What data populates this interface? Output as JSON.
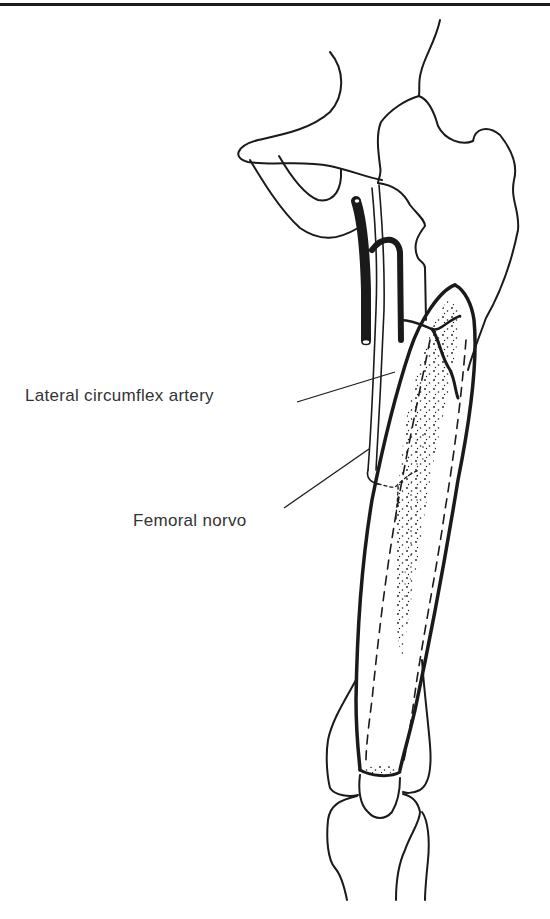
{
  "figure": {
    "type": "anatomical-line-drawing",
    "colors": {
      "ink": "#1a1a1a",
      "background": "#ffffff",
      "label_text": "#333333"
    },
    "labels": [
      {
        "id": "lateral-circumflex-artery",
        "text": "Lateral circumflex artery"
      },
      {
        "id": "femoral-nerve",
        "text": "Femoral norvo"
      }
    ],
    "structures": [
      "pelvis-ilium",
      "femoral-head",
      "greater-trochanter",
      "femoral-vessels",
      "femoral-nerve",
      "lateral-circumflex-artery-branch",
      "rectus-femoris-muscle-flap",
      "patella",
      "knee-joint",
      "tibia",
      "fibula"
    ]
  }
}
